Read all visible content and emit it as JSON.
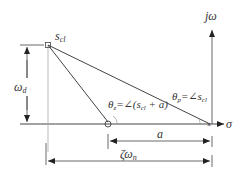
{
  "axes": {
    "imag_label": "jω",
    "real_label": "σ"
  },
  "points": {
    "closed_loop_pole_label": "s",
    "closed_loop_pole_sub": "cl"
  },
  "angles": {
    "theta_z_label": "θ",
    "theta_z_sub": "z",
    "theta_z_eq": "=∠(s",
    "theta_z_eq_sub": "cl",
    "theta_z_eq_tail": " + a)",
    "theta_p_label": "θ",
    "theta_p_sub": "p",
    "theta_p_eq": "=∠s",
    "theta_p_eq_sub": "cl"
  },
  "dimensions": {
    "omega_d_label": "ω",
    "omega_d_sub": "d",
    "a_label": "a",
    "zeta_omega_label": "ζω",
    "zeta_omega_sub": "n"
  },
  "colors": {
    "line": "#444444",
    "light_line": "#999999",
    "text": "#333333"
  }
}
